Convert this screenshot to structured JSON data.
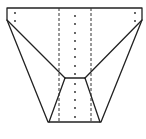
{
  "diagram": {
    "colors": {
      "line": "#222222",
      "background": "#ffffff"
    },
    "outline": {
      "top_left": [
        7,
        8
      ],
      "top_right": [
        142,
        8
      ],
      "left_corner": [
        7,
        20
      ],
      "right_corner": [
        142,
        20
      ],
      "bottom_left": [
        48,
        122
      ],
      "bottom_right": [
        101,
        122
      ]
    },
    "inner": {
      "top_left": [
        65,
        78
      ],
      "top_right": [
        85,
        78
      ]
    },
    "dashed_x": [
      59,
      91
    ],
    "center_dots_x": 75,
    "center_dots_y": [
      16,
      24,
      33,
      41,
      49,
      57,
      66,
      74,
      84,
      92,
      100,
      108,
      117
    ],
    "corner_dots": [
      [
        15,
        13
      ],
      [
        15,
        21
      ],
      [
        135,
        13
      ],
      [
        135,
        21
      ]
    ]
  }
}
